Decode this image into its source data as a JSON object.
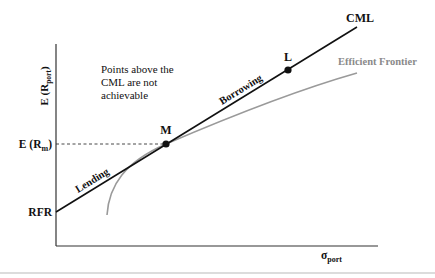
{
  "diagram": {
    "type": "capital-market-line",
    "y_axis_label": {
      "main": "E (R",
      "sub": "port",
      "close": ")"
    },
    "x_axis_label": {
      "main": "σ",
      "sub": "port"
    },
    "annotation": [
      "Points above the",
      "CML are not",
      "achievable"
    ],
    "rfr_label": "RFR",
    "erm_label": {
      "main": "E (R",
      "sub": "m",
      "close": ")"
    },
    "cml_label": "CML",
    "frontier_label": "Efficient Frontier",
    "lending_label": "Lending",
    "borrowing_label": "Borrowing",
    "points": [
      {
        "id": "M",
        "label": "M"
      },
      {
        "id": "L",
        "label": "L"
      }
    ],
    "colors": {
      "cml": "#111111",
      "frontier": "#9a9a9a",
      "frontier_label": "#8a8a8a",
      "axes": "#333333",
      "separator": "#d0d0d0"
    }
  }
}
